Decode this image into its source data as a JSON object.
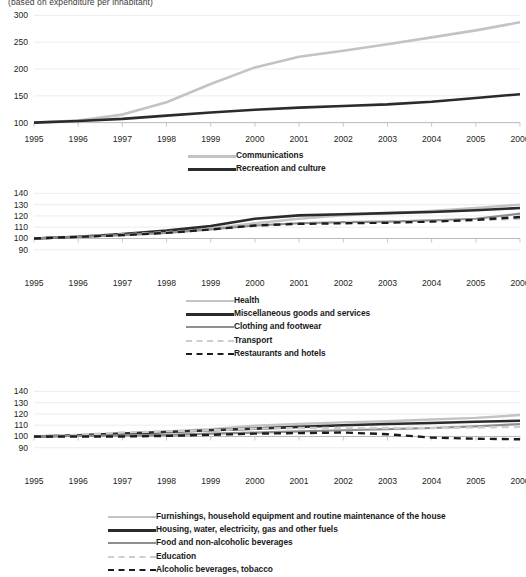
{
  "figure": {
    "supertitle": "(based on expenditure per inhabitant)",
    "xlabel": "",
    "background": "#ffffff",
    "text_color": "#231f20",
    "gridline_color": "#e9e9e9",
    "axis_color": "#b9b9b9"
  },
  "chart_data": [
    {
      "type": "line",
      "id": "panel-top",
      "title": "",
      "xlabel": "",
      "ylabel": "",
      "x": [
        1995,
        1996,
        1997,
        1998,
        1999,
        2000,
        2001,
        2002,
        2003,
        2004,
        2005,
        2006
      ],
      "tick_labels_x": [
        "1995",
        "1996",
        "1997",
        "1998",
        "1999",
        "2000",
        "2001",
        "2002",
        "2003",
        "2004",
        "2005",
        "2006"
      ],
      "ylim": [
        90,
        310
      ],
      "yticks": [
        100,
        150,
        200,
        250,
        300
      ],
      "tick_labels_y": [
        "100",
        "150",
        "200",
        "250",
        "300"
      ],
      "grid": true,
      "legend_position": "below",
      "series": [
        {
          "name": "Communications",
          "color": "#c3c3c3",
          "width": 2.6,
          "dash": "none",
          "values": [
            100,
            104,
            115,
            138,
            172,
            203,
            223,
            234,
            246,
            259,
            272,
            287
          ]
        },
        {
          "name": "Recreation and culture",
          "color": "#2b2b2b",
          "width": 2.6,
          "dash": "none",
          "values": [
            100,
            103,
            107,
            113,
            119,
            124,
            128,
            131,
            134,
            139,
            146,
            153
          ]
        }
      ]
    },
    {
      "type": "line",
      "id": "panel-middle",
      "title": "",
      "xlabel": "",
      "ylabel": "",
      "x": [
        1995,
        1996,
        1997,
        1998,
        1999,
        2000,
        2001,
        2002,
        2003,
        2004,
        2005,
        2006
      ],
      "tick_labels_x": [
        "1995",
        "1996",
        "1997",
        "1998",
        "1999",
        "2000",
        "2001",
        "2002",
        "2003",
        "2004",
        "2005",
        "2006"
      ],
      "ylim": [
        88,
        143
      ],
      "yticks": [
        90,
        100,
        110,
        120,
        130,
        140
      ],
      "tick_labels_y": [
        "90",
        "100",
        "110",
        "120",
        "130",
        "140"
      ],
      "grid": true,
      "legend_position": "below",
      "series": [
        {
          "name": "Health",
          "color": "#c3c3c3",
          "width": 2.4,
          "dash": "none",
          "values": [
            100,
            101.5,
            103.5,
            106,
            109,
            113.5,
            117.5,
            120.5,
            122.5,
            124.5,
            127,
            130
          ]
        },
        {
          "name": "Miscellaneous goods and services",
          "color": "#2b2b2b",
          "width": 2.6,
          "dash": "none",
          "values": [
            100,
            101.5,
            104,
            107,
            111,
            117.5,
            120.5,
            121.5,
            122.5,
            123.5,
            125,
            127
          ]
        },
        {
          "name": "Clothing and footwear",
          "color": "#8e8e8e",
          "width": 2.2,
          "dash": "none",
          "values": [
            100,
            101.5,
            103,
            105,
            108,
            111.5,
            113.5,
            114.5,
            115,
            116,
            117.5,
            122
          ]
        },
        {
          "name": "Transport",
          "color": "#cdcdcd",
          "width": 2.4,
          "dash": "dashed",
          "values": [
            100,
            102,
            103.5,
            105.5,
            108.5,
            112,
            113.5,
            114.5,
            115,
            115.5,
            116.5,
            117.5
          ]
        },
        {
          "name": "Restaurants and hotels",
          "color": "#1c1c1c",
          "width": 2.4,
          "dash": "dashed",
          "values": [
            100,
            101.5,
            103,
            105,
            108,
            111.5,
            113,
            113.5,
            114,
            115,
            116.5,
            119
          ]
        }
      ]
    },
    {
      "type": "line",
      "id": "panel-bottom",
      "title": "",
      "xlabel": "",
      "ylabel": "",
      "x": [
        1995,
        1996,
        1997,
        1998,
        1999,
        2000,
        2001,
        2002,
        2003,
        2004,
        2005,
        2006
      ],
      "tick_labels_x": [
        "1995",
        "1996",
        "1997",
        "1998",
        "1999",
        "2000",
        "2001",
        "2002",
        "2003",
        "2004",
        "2005",
        "2006"
      ],
      "ylim": [
        88,
        143
      ],
      "yticks": [
        90,
        100,
        110,
        120,
        130,
        140
      ],
      "tick_labels_y": [
        "90",
        "100",
        "110",
        "120",
        "130",
        "140"
      ],
      "grid": true,
      "legend_position": "below",
      "series": [
        {
          "name": "Furnishings, household equipment and routine maintenance of the house",
          "color": "#c3c3c3",
          "width": 2.4,
          "dash": "none",
          "values": [
            100,
            101,
            102.5,
            104.5,
            106.5,
            109.5,
            111,
            112.5,
            113.5,
            115,
            116.5,
            119
          ]
        },
        {
          "name": "Housing, water, electricity, gas and other fuels",
          "color": "#2b2b2b",
          "width": 2.6,
          "dash": "none",
          "values": [
            100,
            101,
            102.5,
            104,
            105.5,
            107,
            108.5,
            110,
            111,
            112,
            113,
            114
          ]
        },
        {
          "name": "Food and non-alcoholic beverages",
          "color": "#8e8e8e",
          "width": 2.2,
          "dash": "none",
          "values": [
            100,
            100.5,
            101,
            101.5,
            102.5,
            103.5,
            104.5,
            105.5,
            106.5,
            107.5,
            109,
            111
          ]
        },
        {
          "name": "Education",
          "color": "#cdcdcd",
          "width": 2.4,
          "dash": "dashed",
          "values": [
            100,
            101.5,
            103.5,
            104.5,
            105.5,
            107,
            107.5,
            107.5,
            107.5,
            107.5,
            108,
            108.5
          ]
        },
        {
          "name": "Alcoholic beverages, tobacco",
          "color": "#1c1c1c",
          "width": 2.4,
          "dash": "dashed",
          "values": [
            100,
            100,
            100,
            100.5,
            101.5,
            102.5,
            103,
            103.5,
            102,
            99,
            98,
            97.5
          ]
        }
      ]
    }
  ]
}
